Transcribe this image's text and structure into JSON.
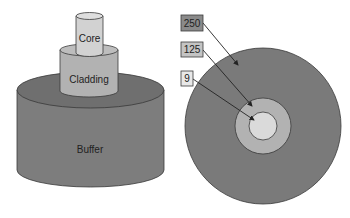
{
  "diagram": {
    "cylinder_labels": {
      "core": "Core",
      "cladding": "Cladding",
      "buffer": "Buffer"
    },
    "cross_section_labels": [
      {
        "value": "250",
        "target": "buffer"
      },
      {
        "value": "125",
        "target": "cladding"
      },
      {
        "value": "9",
        "target": "core"
      }
    ],
    "colors": {
      "core": "#d2d2d2",
      "cladding": "#b2b2b2",
      "buffer": "#7a7a7a",
      "label_250_bg": "#8a8a8a",
      "label_125_bg": "#c4c4c4",
      "label_9_bg": "#e8e8e8",
      "outline": "#3a3a3a"
    }
  }
}
